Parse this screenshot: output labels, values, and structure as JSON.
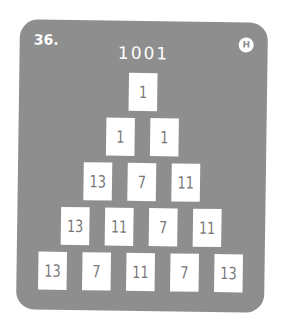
{
  "puzzle": {
    "number": "36.",
    "difficulty_badge": "H",
    "target": "1001",
    "rows": [
      [
        "1"
      ],
      [
        "1",
        "1"
      ],
      [
        "13",
        "7",
        "11"
      ],
      [
        "13",
        "11",
        "7",
        "11"
      ],
      [
        "13",
        "7",
        "11",
        "7",
        "13"
      ]
    ]
  },
  "colors": {
    "card_background": "#8e8e8e",
    "box_background": "#ffffff",
    "box_text": "#777777"
  }
}
